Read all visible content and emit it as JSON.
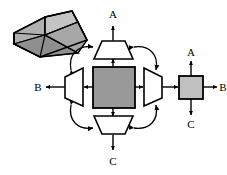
{
  "figure": {
    "background_color": "#ffffff",
    "line_color": "#000000",
    "labels": {
      "top_axis": "A",
      "left_axis": "B",
      "bottom_axis": "C",
      "small_square_top": "A",
      "small_square_right": "B",
      "small_square_bottom": "C"
    },
    "colors": {
      "center_square_fill": "#999999",
      "small_square_fill": "#c0c0c0",
      "solid_top_face_fill": "#b4b4b4",
      "solid_front_face_fill": "#8c8c8c",
      "solid_side_face_fill": "#a0a0a0",
      "trapezoid_fill": "#ffffff",
      "stroke": "#000000"
    },
    "elements": [
      {
        "name": "frustum-solid",
        "kind": "3d-solid",
        "description": "shaded truncated square pyramid drawn in oblique projection, top-left corner"
      },
      {
        "name": "top-trapezoid",
        "kind": "trapezoid",
        "orientation": "narrow-top",
        "description": "top projection view, wide edge at bottom"
      },
      {
        "name": "left-trapezoid",
        "kind": "trapezoid",
        "orientation": "narrow-left",
        "description": "left projection view, wide edge at right"
      },
      {
        "name": "right-trapezoid",
        "kind": "trapezoid",
        "orientation": "narrow-right",
        "description": "right projection view, wide edge at left"
      },
      {
        "name": "bottom-trapezoid",
        "kind": "trapezoid",
        "orientation": "narrow-bottom",
        "description": "bottom projection view, wide edge at top"
      },
      {
        "name": "center-square",
        "kind": "square",
        "fill": "#999999",
        "description": "central shaded square, plan view of the frustum"
      },
      {
        "name": "small-square",
        "kind": "square",
        "fill": "#c0c0c0",
        "description": "small shaded square at far right with A / B / C axis labels"
      }
    ],
    "connectors": {
      "straight_double_arrows": [
        "center-square to top-trapezoid",
        "center-square to left-trapezoid",
        "center-square to right-trapezoid",
        "center-square to bottom-trapezoid",
        "left-trapezoid to B label",
        "right-trapezoid to small-square",
        "top-trapezoid to A label",
        "bottom-trapezoid to C label",
        "small-square to A label",
        "small-square to B label",
        "small-square to C label"
      ],
      "curved_double_arrows": [
        "left-trapezoid to top-trapezoid (upper-left arc)",
        "top-trapezoid to right-trapezoid (upper-right arc)",
        "left-trapezoid to bottom-trapezoid (lower-left arc)",
        "bottom-trapezoid to right-trapezoid (lower-right arc)"
      ]
    }
  }
}
